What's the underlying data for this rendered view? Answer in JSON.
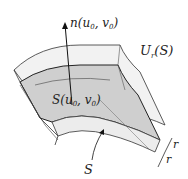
{
  "figure": {
    "normal_label": {
      "name": "n",
      "args": "u",
      "sub0": "0",
      "sep": ",",
      "v": "v",
      "sub1": "0"
    },
    "neighborhood_label": {
      "U": "U",
      "sub": "r",
      "arg": "(S)"
    },
    "point_label": {
      "S": "S(u",
      "sub0": "0",
      "sep": ", v",
      "sub1": "0",
      "close": ")"
    },
    "surface_label": "S",
    "thickness_labels": [
      "r",
      "r"
    ],
    "colors": {
      "outer_shell": "#f2f2f2",
      "surface_fill": "#cfcfcf",
      "lower_shell": "#ececec",
      "stroke": "#222222"
    }
  }
}
